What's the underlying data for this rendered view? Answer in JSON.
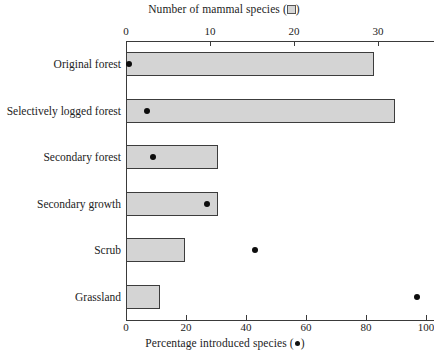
{
  "chart_data": {
    "type": "bar",
    "title": "",
    "categories": [
      "Original forest",
      "Selectively logged forest",
      "Secondary forest",
      "Secondary growth",
      "Scrub",
      "Grassland"
    ],
    "series": [
      {
        "name": "Number of mammal species",
        "marker": "open-square",
        "axis": "top",
        "values": [
          29.5,
          32,
          11,
          11,
          7,
          4
        ]
      },
      {
        "name": "Percentage introduced species",
        "marker": "filled-circle",
        "axis": "bottom",
        "values": [
          1,
          7,
          9,
          27,
          43,
          97
        ]
      }
    ],
    "top_axis": {
      "label": "Number of mammal species",
      "legend_glyph": "open-square",
      "ticks": [
        0,
        10,
        20,
        30
      ],
      "range": [
        0,
        36.7
      ],
      "tick_labels": [
        "0",
        "10",
        "20",
        "30"
      ]
    },
    "bottom_axis": {
      "label": "Percentage introduced species",
      "legend_glyph": "filled-circle",
      "ticks": [
        0,
        20,
        40,
        60,
        80,
        100
      ],
      "range": [
        0,
        102.7
      ],
      "tick_labels": [
        "0",
        "20",
        "40",
        "60",
        "80",
        "100"
      ]
    },
    "ylabel": "",
    "grid": false,
    "legend_position": "axis-titles",
    "colors": {
      "bar_fill": "#d4d4d4",
      "bar_border": "#3c3c3c",
      "dot": "#0d0d0d",
      "axis": "#3a3a3a",
      "text": "#232323"
    }
  },
  "top_axis_title_text": "Number of mammal species (",
  "top_axis_title_tail": ")",
  "bottom_axis_title_text": "Percentage introduced species (",
  "bottom_axis_title_tail": ")"
}
